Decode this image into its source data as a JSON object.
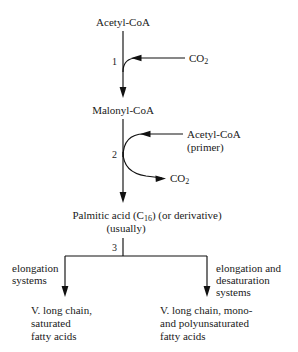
{
  "diagram": {
    "line_color": "#111111",
    "background": "#ffffff"
  },
  "nodes": {
    "start": "Acetyl-CoA",
    "intermediate": "Malonyl-CoA",
    "palmitic_line1": "Palmitic acid (C",
    "palmitic_sub": "16",
    "palmitic_line1b": ") (or derivative)",
    "palmitic_line2": "(usually)"
  },
  "steps": [
    {
      "number": "1",
      "label": "step-1"
    },
    {
      "number": "2",
      "label": "step-2"
    },
    {
      "number": "3",
      "label": "step-3"
    }
  ],
  "side_labels": {
    "co2_step1": "CO",
    "co2_step1_sub": "2",
    "acetyl_primer_line1": "Acetyl-CoA",
    "acetyl_primer_line2": "(primer)",
    "co2_step2": "CO",
    "co2_step2_sub": "2"
  },
  "branches": {
    "left": {
      "enzyme_line1": "elongation",
      "enzyme_line2": "systems",
      "product_line1": "V. long chain,",
      "product_line2": "saturated",
      "product_line3": "fatty acids"
    },
    "right": {
      "enzyme_line1": "elongation and",
      "enzyme_line2": "desaturation",
      "enzyme_line3": "systems",
      "product_line1": "V. long chain, mono-",
      "product_line2": "and polyunsaturated",
      "product_line3": "fatty acids"
    }
  }
}
